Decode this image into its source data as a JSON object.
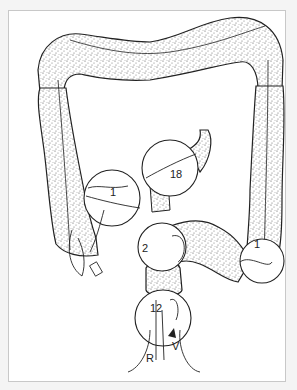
{
  "figure": {
    "labels": {
      "cecum_region": "1",
      "hepatic_region": "18",
      "sigmoid_region": "2",
      "descending_region": "1",
      "rectosigmoid_region": "12",
      "rectum": "R",
      "vagina": "V"
    },
    "colors": {
      "ink": "#222222",
      "stipple": "#555555",
      "background": "#ffffff",
      "border": "#c8c8c8"
    }
  }
}
